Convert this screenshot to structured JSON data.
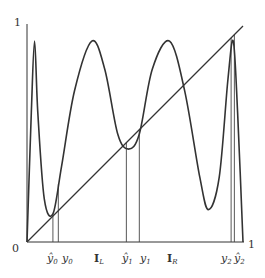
{
  "figure": {
    "title": "",
    "axis": {
      "origin_label": "0",
      "x_end_label": "1",
      "y_end_label": "1",
      "x_range": [
        0,
        1
      ],
      "y_range": [
        0,
        1
      ]
    },
    "curve": {
      "name": "map f",
      "samples": [
        [
          0.0,
          0.0
        ],
        [
          0.02,
          0.6
        ],
        [
          0.035,
          0.93
        ],
        [
          0.05,
          0.6
        ],
        [
          0.08,
          0.2
        ],
        [
          0.12,
          0.13
        ],
        [
          0.16,
          0.35
        ],
        [
          0.22,
          0.7
        ],
        [
          0.3,
          0.93
        ],
        [
          0.36,
          0.8
        ],
        [
          0.42,
          0.5
        ],
        [
          0.47,
          0.43
        ],
        [
          0.52,
          0.5
        ],
        [
          0.58,
          0.8
        ],
        [
          0.66,
          0.93
        ],
        [
          0.73,
          0.7
        ],
        [
          0.8,
          0.3
        ],
        [
          0.84,
          0.15
        ],
        [
          0.89,
          0.3
        ],
        [
          0.93,
          0.75
        ],
        [
          0.955,
          0.93
        ],
        [
          0.975,
          0.6
        ],
        [
          1.0,
          0.0
        ]
      ]
    },
    "diagonal": {
      "from": [
        0,
        0
      ],
      "to": [
        1,
        1
      ]
    },
    "verticals": [
      0.12,
      0.145,
      0.46,
      0.52,
      0.945,
      0.96
    ],
    "labels": [
      {
        "text": "ŷ0",
        "x": 0.12
      },
      {
        "text": "y0",
        "x": 0.155
      },
      {
        "text": "I_L",
        "x": 0.32
      },
      {
        "text": "ŷ1",
        "x": 0.46
      },
      {
        "text": "y1",
        "x": 0.53
      },
      {
        "text": "I_R",
        "x": 0.7
      },
      {
        "text": "y2",
        "x": 0.935
      },
      {
        "text": "ŷ2",
        "x": 0.975
      }
    ],
    "tick_labels": {
      "y0_hat": {
        "base": "y",
        "hat": true,
        "sub": "0"
      },
      "y0": {
        "base": "y",
        "hat": false,
        "sub": "0"
      },
      "IL": {
        "base": "I",
        "sub": "L"
      },
      "y1_hat": {
        "base": "y",
        "hat": true,
        "sub": "1"
      },
      "y1": {
        "base": "y",
        "hat": false,
        "sub": "1"
      },
      "IR": {
        "base": "I",
        "sub": "R"
      },
      "y2": {
        "base": "y",
        "hat": false,
        "sub": "2"
      },
      "y2_hat": {
        "base": "y",
        "hat": true,
        "sub": "2"
      }
    }
  }
}
